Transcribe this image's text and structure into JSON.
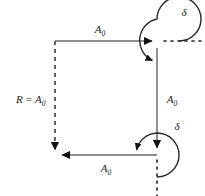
{
  "figure": {
    "type": "geometric-vector-diagram",
    "background_color": "#ffffff",
    "stroke_color": "#3a3a3a",
    "text_color": "#1a1a1a"
  },
  "labels": {
    "top_segment": {
      "symbol": "A",
      "subscript": "0",
      "text": "A0"
    },
    "right_segment": {
      "symbol": "A",
      "subscript": "0",
      "text": "A0"
    },
    "bottom_segment": {
      "symbol": "A",
      "subscript": "0",
      "text": "A0"
    },
    "left_segment": {
      "prefix": "R",
      "equals": "=",
      "symbol": "A",
      "subscript": "0",
      "text": "R = A0"
    },
    "top_angle": {
      "symbol": "δ",
      "text": "δ"
    },
    "bottom_angle": {
      "symbol": "δ",
      "text": "δ"
    }
  },
  "geometry": {
    "top_left": {
      "x": 55,
      "y": 41
    },
    "top_right": {
      "x": 157,
      "y": 41
    },
    "bottom_right": {
      "x": 157,
      "y": 155
    },
    "bottom_left": {
      "x": 55,
      "y": 155
    },
    "arc_radius": 22,
    "dash_pattern": "4,4",
    "dot_pattern": "2,5"
  }
}
